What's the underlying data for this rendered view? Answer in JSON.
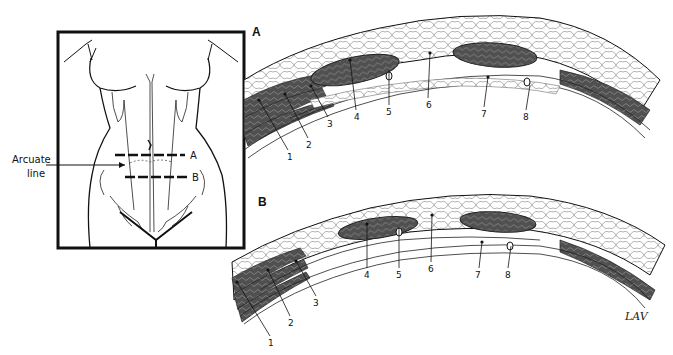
{
  "figure": {
    "inset": {
      "labels": {
        "arcuate_line": "Arcuate\nline",
        "arcuate_line_1": "Arcuate",
        "arcuate_line_2": "line",
        "section_a": "A",
        "section_b": "B"
      }
    },
    "panel_a": {
      "letter": "A",
      "callouts": [
        "1",
        "2",
        "3",
        "4",
        "5",
        "6",
        "7",
        "8"
      ]
    },
    "panel_b": {
      "letter": "B",
      "callouts": [
        "1",
        "2",
        "3",
        "4",
        "5",
        "6",
        "7",
        "8"
      ]
    },
    "signature": "LAV"
  },
  "colors": {
    "ink": "#111111",
    "muscle": "#4a4a4a",
    "background": "#ffffff"
  }
}
